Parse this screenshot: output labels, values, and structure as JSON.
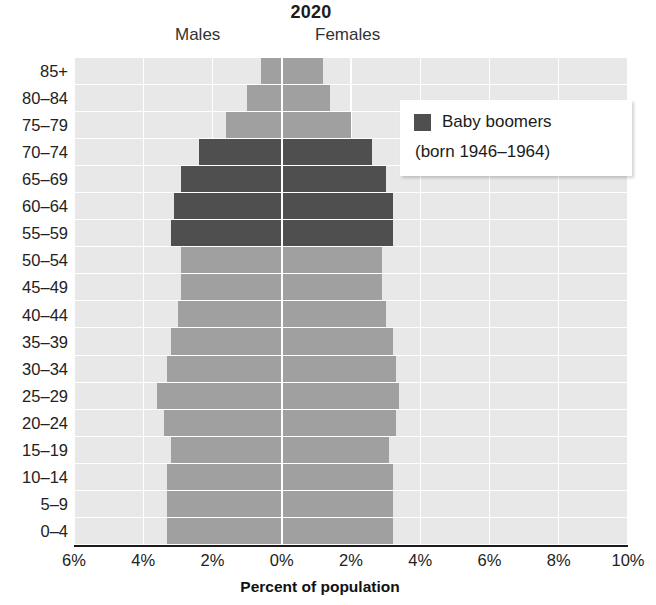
{
  "chart_data": {
    "type": "bar",
    "subtype": "population-pyramid",
    "title": "2020",
    "xlabel": "Percent of population",
    "ylabel": "",
    "left_series_label": "Males",
    "right_series_label": "Females",
    "xlim": [
      -6,
      10
    ],
    "xticks": [
      -6,
      -4,
      -2,
      0,
      2,
      4,
      6,
      8,
      10
    ],
    "xtick_labels": [
      "6%",
      "4%",
      "2%",
      "0%",
      "2%",
      "4%",
      "6%",
      "8%",
      "10%"
    ],
    "grid": true,
    "legend_position": "upper-right-inside",
    "categories": [
      "85+",
      "80–84",
      "75–79",
      "70–74",
      "65–69",
      "60–64",
      "55–59",
      "50–54",
      "45–49",
      "40–44",
      "35–39",
      "30–34",
      "25–29",
      "20–24",
      "15–19",
      "10–14",
      "5–9",
      "0–4"
    ],
    "series": [
      {
        "name": "Males",
        "side": "left",
        "values": [
          0.6,
          1.0,
          1.6,
          2.4,
          2.9,
          3.1,
          3.2,
          2.9,
          2.9,
          3.0,
          3.2,
          3.3,
          3.6,
          3.4,
          3.2,
          3.3,
          3.3,
          3.3
        ]
      },
      {
        "name": "Females",
        "side": "right",
        "values": [
          1.2,
          1.4,
          2.0,
          2.6,
          3.0,
          3.2,
          3.2,
          2.9,
          2.9,
          3.0,
          3.2,
          3.3,
          3.4,
          3.3,
          3.1,
          3.2,
          3.2,
          3.2
        ]
      }
    ],
    "highlight": {
      "label": "Baby boomers",
      "sublabel": "(born 1946–1964)",
      "color": "#4f4f4f",
      "categories": [
        "70–74",
        "65–69",
        "60–64",
        "55–59"
      ]
    },
    "colors": {
      "bar": "#a0a0a0",
      "highlight_bar": "#4f4f4f",
      "plot_background": "#e8e8e8",
      "gridline": "#ffffff",
      "axis": "#1b1b1b",
      "text": "#1b1b1b"
    },
    "bar_rows": [
      {
        "age": "85+",
        "male": 0.6,
        "female": 1.2,
        "boomer": false
      },
      {
        "age": "80–84",
        "male": 1.0,
        "female": 1.4,
        "boomer": false
      },
      {
        "age": "75–79",
        "male": 1.6,
        "female": 2.0,
        "boomer": false
      },
      {
        "age": "70–74",
        "male": 2.4,
        "female": 2.6,
        "boomer": true
      },
      {
        "age": "65–69",
        "male": 2.9,
        "female": 3.0,
        "boomer": true
      },
      {
        "age": "60–64",
        "male": 3.1,
        "female": 3.2,
        "boomer": true
      },
      {
        "age": "55–59",
        "male": 3.2,
        "female": 3.2,
        "boomer": true
      },
      {
        "age": "50–54",
        "male": 2.9,
        "female": 2.9,
        "boomer": false
      },
      {
        "age": "45–49",
        "male": 2.9,
        "female": 2.9,
        "boomer": false
      },
      {
        "age": "40–44",
        "male": 3.0,
        "female": 3.0,
        "boomer": false
      },
      {
        "age": "35–39",
        "male": 3.2,
        "female": 3.2,
        "boomer": false
      },
      {
        "age": "30–34",
        "male": 3.3,
        "female": 3.3,
        "boomer": false
      },
      {
        "age": "25–29",
        "male": 3.6,
        "female": 3.4,
        "boomer": false
      },
      {
        "age": "20–24",
        "male": 3.4,
        "female": 3.3,
        "boomer": false
      },
      {
        "age": "15–19",
        "male": 3.2,
        "female": 3.1,
        "boomer": false
      },
      {
        "age": "10–14",
        "male": 3.3,
        "female": 3.2,
        "boomer": false
      },
      {
        "age": "5–9",
        "male": 3.3,
        "female": 3.2,
        "boomer": false
      },
      {
        "age": "0–4",
        "male": 3.3,
        "female": 3.2,
        "boomer": false
      }
    ]
  }
}
